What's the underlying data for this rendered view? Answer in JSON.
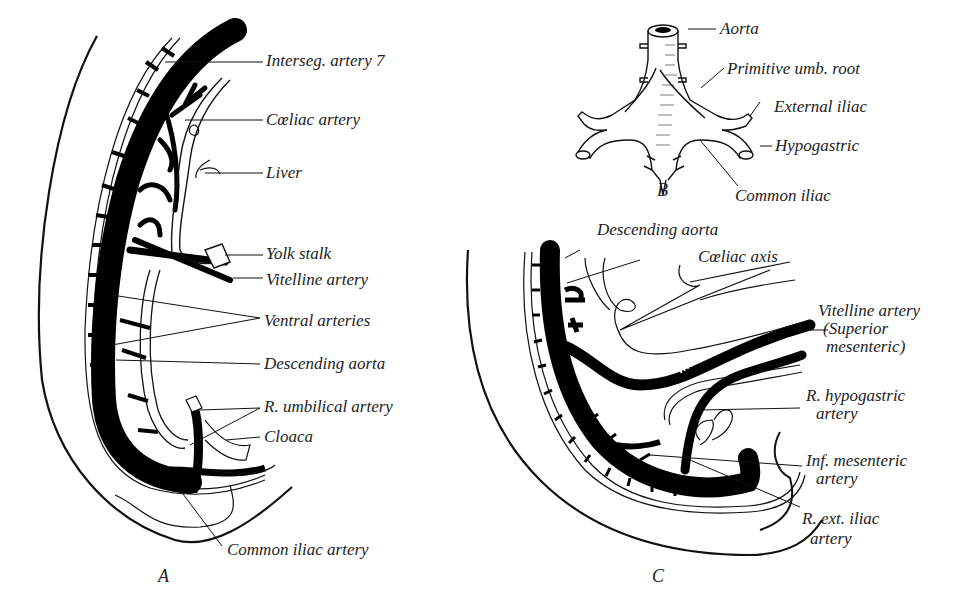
{
  "figure": {
    "panels": {
      "a": "A",
      "b": "B",
      "c": "C"
    },
    "panel_a": {
      "labels": {
        "interseg": "Interseg. artery 7",
        "coeliac": "Cœliac artery",
        "liver": "Liver",
        "yolk": "Yolk stalk",
        "vitelline": "Vitelline artery",
        "ventral": "Ventral arteries",
        "desc_aorta": "Descending aorta",
        "umbilical": "R. umbilical artery",
        "cloaca": "Cloaca",
        "common_iliac": "Common iliac artery"
      }
    },
    "panel_b": {
      "labels": {
        "aorta": "Aorta",
        "umb_root": "Primitive umb. root",
        "ext_iliac": "External iliac",
        "hypogastric": "Hypogastric",
        "common_iliac": "Common iliac"
      }
    },
    "panel_c": {
      "labels": {
        "desc_aorta": "Descending aorta",
        "coeliac_axis": "Cœliac axis",
        "vitelline_1": "Vitelline artery",
        "vitelline_2": "(Superior",
        "vitelline_3": "mesenteric)",
        "r_hypo_1": "R. hypogastric",
        "r_hypo_2": "artery",
        "inf_mes_1": "Inf. mesenteric",
        "inf_mes_2": "artery",
        "r_ext_1": "R. ext. iliac",
        "r_ext_2": "artery"
      }
    }
  }
}
